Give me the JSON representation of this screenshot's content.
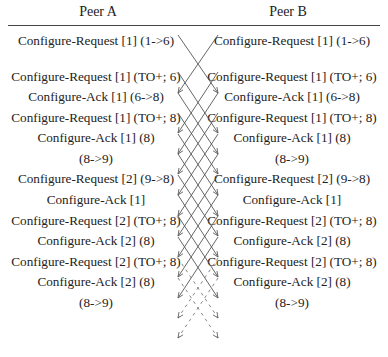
{
  "diagram": {
    "type": "sequence-exchange",
    "peers": [
      {
        "name": "Peer A",
        "rows": [
          "Configure-Request [1] (1->6)",
          "",
          "Configure-Request [1] (TO+; 6)",
          "Configure-Ack [1] (6->8)",
          "Configure-Request [1] (TO+; 8)",
          "Configure-Ack [1] (8)",
          "(8->9)",
          "Configure-Request [2] (9->8)",
          "Configure-Ack [1]",
          "Configure-Request [2] (TO+; 8)",
          "Configure-Ack [2] (8)",
          "Configure-Request [2] (TO+; 8)",
          "Configure-Ack [2] (8)",
          "(8->9)"
        ]
      },
      {
        "name": "Peer B",
        "rows": [
          "Configure-Request [1] (1->6)",
          "",
          "Configure-Request [1] (TO+; 6)",
          "Configure-Ack [1] (6->8)",
          "Configure-Request [1] (TO+; 8)",
          "Configure-Ack [1] (8)",
          "(8->9)",
          "Configure-Request [2] (9->8)",
          "Configure-Ack [1]",
          "Configure-Request [2] (TO+; 8)",
          "Configure-Ack [2] (8)",
          "Configure-Request [2] (TO+; 8)",
          "Configure-Ack [2] (8)",
          "(8->9)"
        ]
      }
    ]
  },
  "header": {
    "peer_a": "Peer A",
    "peer_b": "Peer B"
  },
  "peer_a": {
    "r0": "Configure-Request [1] (1->6)",
    "r2": "Configure-Request [1] (TO+; 6)",
    "r3": "Configure-Ack [1] (6->8)",
    "r4": "Configure-Request [1] (TO+; 8)",
    "r5": "Configure-Ack [1] (8)",
    "r6": "(8->9)",
    "r7": "Configure-Request [2] (9->8)",
    "r8": "Configure-Ack [1]",
    "r9": "Configure-Request [2] (TO+; 8)",
    "r10": "Configure-Ack [2] (8)",
    "r11": "Configure-Request [2] (TO+; 8)",
    "r12": "Configure-Ack [2] (8)",
    "r13": "(8->9)"
  },
  "peer_b": {
    "r0": "Configure-Request [1] (1->6)",
    "r2": "Configure-Request [1] (TO+; 6)",
    "r3": "Configure-Ack [1] (6->8)",
    "r4": "Configure-Request [1] (TO+; 8)",
    "r5": "Configure-Ack [1] (8)",
    "r6": "(8->9)",
    "r7": "Configure-Request [2] (9->8)",
    "r8": "Configure-Ack [1]",
    "r9": "Configure-Request [2] (TO+; 8)",
    "r10": "Configure-Ack [2] (8)",
    "r11": "Configure-Request [2] (TO+; 8)",
    "r12": "Configure-Ack [2] (8)",
    "r13": "(8->9)"
  }
}
